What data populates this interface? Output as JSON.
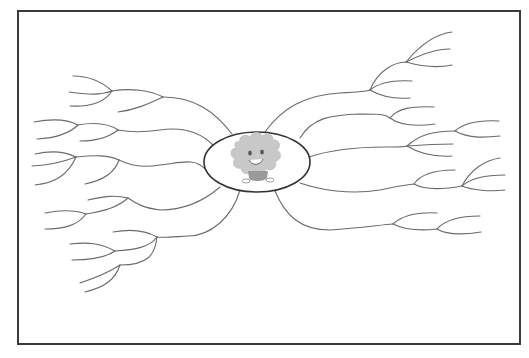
{
  "diagram": {
    "type": "mind-map-template",
    "frame": {
      "border_color": "#3a3a3a",
      "background": "#ffffff"
    },
    "center": {
      "shape": "ellipse",
      "cx": 257,
      "cy": 162,
      "rx": 53,
      "ry": 30,
      "illustration": "smiling-cloud-character-icon",
      "colors": {
        "body": "#c8c8c8",
        "legs": "#9a9a9a",
        "face": "#555555"
      }
    },
    "line_color": "#6a6a6a",
    "branch_count": {
      "left": 5,
      "right": 5
    },
    "labels": []
  }
}
